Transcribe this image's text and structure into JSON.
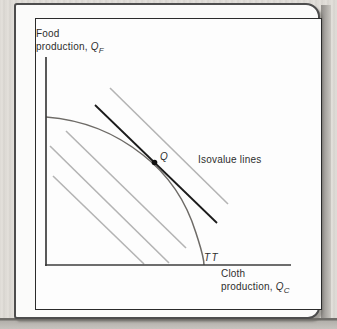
{
  "page": {
    "background_color": "#dcd9d4",
    "card_color": "#fbfbfa",
    "frame_color": "#2b2b2b"
  },
  "labels": {
    "y_axis": {
      "line1": "Food",
      "line2_prefix": "production, ",
      "symbol": "Q",
      "subscript": "F"
    },
    "x_axis": {
      "line1": "Cloth",
      "line2_prefix": "production, ",
      "symbol": "Q",
      "subscript": "C"
    },
    "isovalue": "Isovalue lines",
    "curve_label": "TT",
    "point_label": "Q"
  },
  "chart_data": {
    "type": "line",
    "title": "",
    "axes": {
      "y_axis": {
        "x1": 46,
        "y1": 57,
        "x2": 46,
        "y2": 266
      },
      "x_axis": {
        "x1": 45,
        "y1": 265,
        "x2": 291,
        "y2": 265
      }
    },
    "isovalue_lines": [
      {
        "x1": 110,
        "y1": 88,
        "x2": 228,
        "y2": 204
      },
      {
        "x1": 66,
        "y1": 131,
        "x2": 186,
        "y2": 248
      },
      {
        "x1": 50,
        "y1": 146,
        "x2": 169,
        "y2": 263
      },
      {
        "x1": 53,
        "y1": 176,
        "x2": 144,
        "y2": 264
      }
    ],
    "tangent_line": {
      "x1": 95,
      "y1": 105,
      "x2": 217,
      "y2": 223
    },
    "curve_path": "M 46 117 C 85 120 115 133 143 155 C 170 176 187 204 196 233 C 201 249 204 257 204 265",
    "point": {
      "x": 154.5,
      "y": 162.5,
      "r": 2.8,
      "label": "Q"
    },
    "colors": {
      "axis": "#3c3c3c",
      "isovalue": "#b4b4b4",
      "tangent": "#1b1b1b",
      "curve": "#6e6b67",
      "point": "#111111"
    }
  }
}
